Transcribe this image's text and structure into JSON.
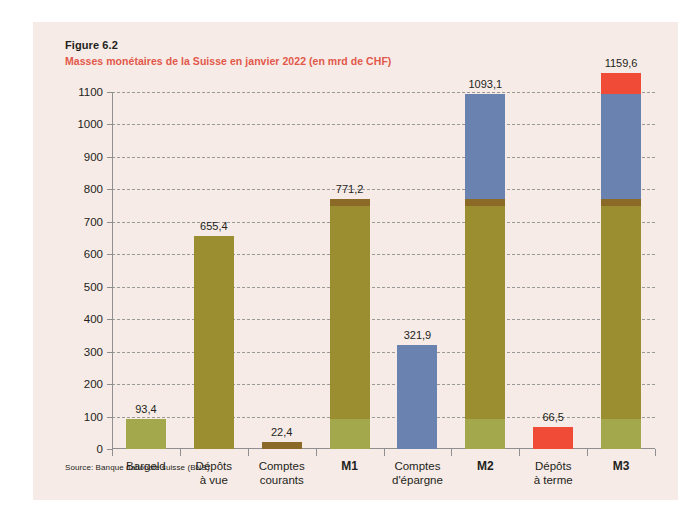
{
  "figure": {
    "number": "Figure 6.2",
    "title": "Masses monétaires de la Suisse en janvier 2022 (en mrd de CHF)",
    "source": "Source: Banque nationale suisse (BNS)"
  },
  "colors": {
    "panel_background": "#f7ebe7",
    "page_background": "#ffffff",
    "title_accent": "#e2584a",
    "text": "#231f20",
    "gridline": "#8b8b8b",
    "axis": "#8f8f8f",
    "bargeld": "#a3a84c",
    "depots_a_vue": "#9a8e31",
    "comptes_courants": "#8a6a26",
    "comptes_epargne": "#6a82b0",
    "depots_a_terme": "#f04b37"
  },
  "chart_data": {
    "type": "bar",
    "title": "Masses monétaires de la Suisse en janvier 2022 (en mrd de CHF)",
    "subtitle": "Figure 6.2",
    "xlabel": "",
    "ylabel": "",
    "ylim": [
      0,
      1100
    ],
    "ytick_step": 100,
    "yticks": [
      0,
      100,
      200,
      300,
      400,
      500,
      600,
      700,
      800,
      900,
      1000,
      1100
    ],
    "ytick_labels": [
      "0",
      "100",
      "200",
      "300",
      "400",
      "500",
      "600",
      "700",
      "800",
      "900",
      "1000",
      "1100"
    ],
    "grid": true,
    "grid_style": "dashed",
    "legend": false,
    "stacked": true,
    "categories": [
      "Bargeld",
      "Dépôts à vue",
      "Comptes courants",
      "M1",
      "Comptes d'épargne",
      "M2",
      "Dépôts à terme",
      "M3"
    ],
    "category_labels": [
      {
        "line1": "Bargeld",
        "line2": "",
        "bold": false
      },
      {
        "line1": "Dépôts",
        "line2": "à vue",
        "bold": false
      },
      {
        "line1": "Comptes",
        "line2": "courants",
        "bold": false
      },
      {
        "line1": "M1",
        "line2": "",
        "bold": true
      },
      {
        "line1": "Comptes",
        "line2": "d'épargne",
        "bold": false
      },
      {
        "line1": "M2",
        "line2": "",
        "bold": true
      },
      {
        "line1": "Dépôts",
        "line2": "à terme",
        "bold": false
      },
      {
        "line1": "M3",
        "line2": "",
        "bold": true
      }
    ],
    "totals": [
      93.4,
      655.4,
      22.4,
      771.2,
      321.9,
      1093.1,
      66.5,
      1159.6
    ],
    "total_labels": [
      "93,4",
      "655,4",
      "22,4",
      "771,2",
      "321,9",
      "1093,1",
      "66,5",
      "1159,6"
    ],
    "components": [
      "Bargeld",
      "Dépôts à vue",
      "Comptes courants",
      "Comptes d'épargne",
      "Dépôts à terme"
    ],
    "component_colors": [
      "#a3a84c",
      "#9a8e31",
      "#8a6a26",
      "#6a82b0",
      "#f04b37"
    ],
    "bars": [
      {
        "name": "Bargeld",
        "label": "93,4",
        "total": 93.4,
        "segments": [
          {
            "component": "Bargeld",
            "value": 93.4,
            "color": "#a3a84c"
          }
        ]
      },
      {
        "name": "Dépôts à vue",
        "label": "655,4",
        "total": 655.4,
        "segments": [
          {
            "component": "Dépôts à vue",
            "value": 655.4,
            "color": "#9a8e31"
          }
        ]
      },
      {
        "name": "Comptes courants",
        "label": "22,4",
        "total": 22.4,
        "segments": [
          {
            "component": "Comptes courants",
            "value": 22.4,
            "color": "#8a6a26"
          }
        ]
      },
      {
        "name": "M1",
        "label": "771,2",
        "total": 771.2,
        "segments": [
          {
            "component": "Bargeld",
            "value": 93.4,
            "color": "#a3a84c"
          },
          {
            "component": "Dépôts à vue",
            "value": 655.4,
            "color": "#9a8e31"
          },
          {
            "component": "Comptes courants",
            "value": 22.4,
            "color": "#8a6a26"
          }
        ]
      },
      {
        "name": "Comptes d'épargne",
        "label": "321,9",
        "total": 321.9,
        "segments": [
          {
            "component": "Comptes d'épargne",
            "value": 321.9,
            "color": "#6a82b0"
          }
        ]
      },
      {
        "name": "M2",
        "label": "1093,1",
        "total": 1093.1,
        "segments": [
          {
            "component": "Bargeld",
            "value": 93.4,
            "color": "#a3a84c"
          },
          {
            "component": "Dépôts à vue",
            "value": 655.4,
            "color": "#9a8e31"
          },
          {
            "component": "Comptes courants",
            "value": 22.4,
            "color": "#8a6a26"
          },
          {
            "component": "Comptes d'épargne",
            "value": 321.9,
            "color": "#6a82b0"
          }
        ]
      },
      {
        "name": "Dépôts à terme",
        "label": "66,5",
        "total": 66.5,
        "segments": [
          {
            "component": "Dépôts à terme",
            "value": 66.5,
            "color": "#f04b37"
          }
        ]
      },
      {
        "name": "M3",
        "label": "1159,6",
        "total": 1159.6,
        "segments": [
          {
            "component": "Bargeld",
            "value": 93.4,
            "color": "#a3a84c"
          },
          {
            "component": "Dépôts à vue",
            "value": 655.4,
            "color": "#9a8e31"
          },
          {
            "component": "Comptes courants",
            "value": 22.4,
            "color": "#8a6a26"
          },
          {
            "component": "Comptes d'épargne",
            "value": 321.9,
            "color": "#6a82b0"
          },
          {
            "component": "Dépôts à terme",
            "value": 66.5,
            "color": "#f04b37"
          }
        ]
      }
    ]
  }
}
